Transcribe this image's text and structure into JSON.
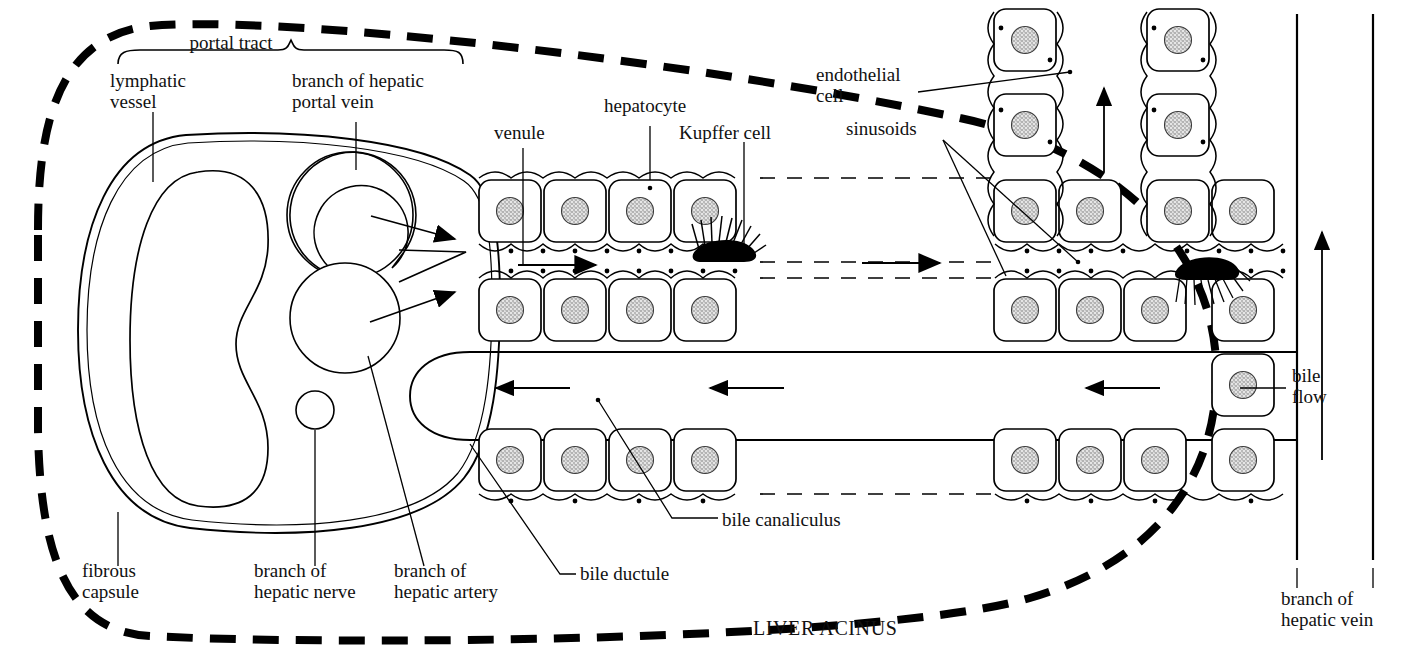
{
  "figure": {
    "kind": "anatomical-diagram",
    "background_color": "#ffffff",
    "ink_color": "#000000",
    "nucleus_fill": "#d8d8d8"
  },
  "labels": {
    "portal_tract": "portal tract",
    "lymphatic_vessel": "lymphatic\nvessel",
    "branch_of_hepatic_portal_vein": "branch of hepatic\nportal vein",
    "venule": "venule",
    "hepatocyte": "hepatocyte",
    "kupffer_cell": "Kupffer cell",
    "endothelial_cell": "endothelial\ncell",
    "sinusoids": "sinusoids",
    "bile_flow": "bile\nflow",
    "bile_canaliculus": "bile canaliculus",
    "bile_ductule": "bile ductule",
    "fibrous_capsule": "fibrous\ncapsule",
    "branch_of_hepatic_nerve": "branch of\nhepatic nerve",
    "branch_of_hepatic_artery": "branch of\nhepatic artery",
    "branch_of_hepatic_vein": "branch of\nhepatic vein",
    "liver_acinus": "LIVER ACINUS"
  },
  "structures": [
    {
      "name": "acinus-boundary",
      "style": "thick dashed closed curve",
      "meaning": "outline of the liver acinus"
    },
    {
      "name": "fibrous-capsule",
      "style": "double thin line",
      "meaning": "connective tissue capsule of portal tract"
    },
    {
      "name": "lymphatic-vessel",
      "style": "kidney-bean outline",
      "count": 1
    },
    {
      "name": "hepatic-portal-vein-branch",
      "style": "circle outline",
      "count": 2
    },
    {
      "name": "hepatic-nerve-branch",
      "style": "small circle outline",
      "count": 1
    },
    {
      "name": "hepatic-artery-branch",
      "style": "small circle outline",
      "count": 1
    },
    {
      "name": "bile-ductule",
      "style": "rounded U-shaped channel",
      "count": 1
    },
    {
      "name": "hepatocyte",
      "style": "rounded square with stippled nucleus",
      "count": 46
    },
    {
      "name": "kupffer-cell",
      "style": "black spiky cell",
      "count": 2
    },
    {
      "name": "sinusoid",
      "style": "dashed lane between hepatocyte plates",
      "count": 3
    },
    {
      "name": "blood-flow-arrow",
      "direction": "left-to-right",
      "count": 4
    },
    {
      "name": "bile-flow-arrow",
      "direction": "right-to-left",
      "count": 3
    },
    {
      "name": "hepatic-vein-flow-arrow",
      "direction": "upward",
      "count": 2
    }
  ]
}
